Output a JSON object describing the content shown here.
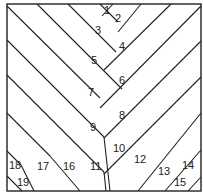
{
  "diagram": {
    "type": "herringbone-parquet-pattern",
    "stroke": "#222222",
    "background": "#ffffff",
    "frame": {
      "x": 7,
      "y": 4,
      "w": 194,
      "h": 187
    },
    "lines": [
      [
        7,
        6,
        100,
        98
      ],
      [
        37,
        4,
        122,
        89
      ],
      [
        68,
        4,
        116,
        52
      ],
      [
        100,
        4,
        118,
        22
      ],
      [
        7,
        40,
        104,
        137
      ],
      [
        7,
        75,
        104,
        172
      ],
      [
        7,
        113,
        50,
        156
      ],
      [
        7,
        151,
        21,
        165
      ],
      [
        21,
        165,
        34,
        191
      ],
      [
        7,
        176,
        22,
        191
      ],
      [
        50,
        156,
        80,
        191
      ],
      [
        104,
        137,
        110,
        191
      ],
      [
        104,
        172,
        106,
        191
      ],
      [
        113,
        4,
        102,
        16
      ],
      [
        141,
        4,
        118,
        32
      ],
      [
        171,
        4,
        104,
        70
      ],
      [
        201,
        6,
        100,
        108
      ],
      [
        201,
        41,
        104,
        138
      ],
      [
        201,
        77,
        104,
        174
      ],
      [
        201,
        113,
        138,
        191
      ],
      [
        201,
        150,
        165,
        191
      ],
      [
        201,
        177,
        188,
        191
      ]
    ],
    "labels": [
      {
        "text": "1",
        "x": 104,
        "y": 14
      },
      {
        "text": "2",
        "x": 115,
        "y": 22
      },
      {
        "text": "3",
        "x": 95,
        "y": 34
      },
      {
        "text": "4",
        "x": 119,
        "y": 50
      },
      {
        "text": "5",
        "x": 91,
        "y": 64
      },
      {
        "text": "6",
        "x": 119,
        "y": 84
      },
      {
        "text": "7",
        "x": 88,
        "y": 96
      },
      {
        "text": "8",
        "x": 119,
        "y": 119
      },
      {
        "text": "9",
        "x": 90,
        "y": 131
      },
      {
        "text": "10",
        "x": 113,
        "y": 152
      },
      {
        "text": "11",
        "x": 90,
        "y": 170
      },
      {
        "text": "12",
        "x": 134,
        "y": 163
      },
      {
        "text": "13",
        "x": 158,
        "y": 175
      },
      {
        "text": "14",
        "x": 182,
        "y": 169
      },
      {
        "text": "15",
        "x": 174,
        "y": 186
      },
      {
        "text": "16",
        "x": 63,
        "y": 170
      },
      {
        "text": "17",
        "x": 37,
        "y": 170
      },
      {
        "text": "18",
        "x": 9,
        "y": 169
      },
      {
        "text": "19",
        "x": 17,
        "y": 186
      }
    ]
  }
}
